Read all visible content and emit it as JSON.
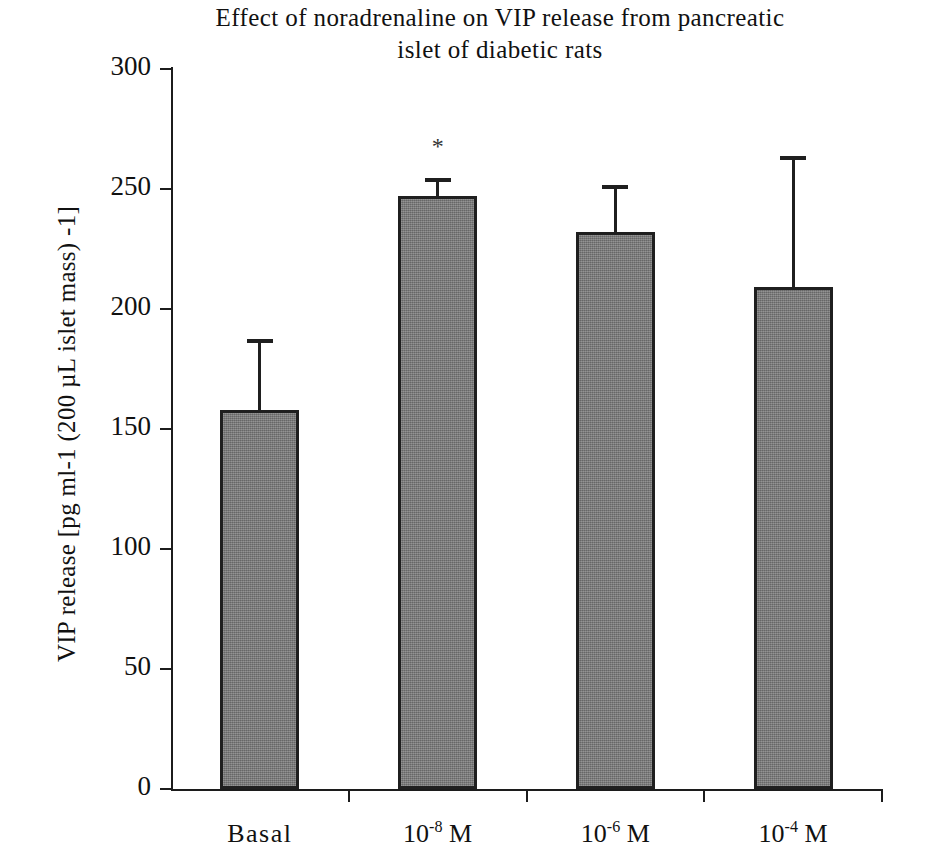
{
  "chart_data": {
    "type": "bar",
    "title": "Effect of noradrenaline on VIP release from pancreatic islet of diabetic rats",
    "title_line1": "Effect of noradrenaline on VIP release from pancreatic",
    "title_line2": "islet of diabetic rats",
    "xlabel": "",
    "ylabel": "VIP release [pg ml-1 (200 µL islet mass) -1]",
    "categories": [
      "Basal",
      "10-8 M",
      "10-6 M",
      "10-4 M"
    ],
    "category_labels": [
      {
        "base": "Basal",
        "exponent": "",
        "suffix": ""
      },
      {
        "base": "10",
        "exponent": "-8",
        "suffix": " M"
      },
      {
        "base": "10",
        "exponent": "-6",
        "suffix": " M"
      },
      {
        "base": "10",
        "exponent": "-4",
        "suffix": " M"
      }
    ],
    "values": [
      158,
      247,
      232,
      209
    ],
    "errors": [
      28,
      6,
      18,
      53
    ],
    "significance": [
      "",
      "*",
      "",
      ""
    ],
    "ylim": [
      0,
      300
    ],
    "ytick_values": [
      0,
      50,
      100,
      150,
      200,
      250,
      300
    ],
    "ytick_labels": [
      "0",
      "50",
      "100",
      "150",
      "200",
      "250",
      "300"
    ],
    "grid": false,
    "legend": null,
    "bar_color": "#7d7d7d",
    "bar_edge_color": "#1f1f1f",
    "axis_color": "#1c1c1c"
  }
}
